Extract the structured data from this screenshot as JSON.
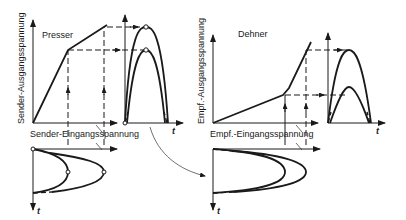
{
  "diagram": {
    "left_panel": {
      "title": "Presser",
      "y_axis_label": "Sender-Ausgangsspannung",
      "x_axis_label": "Sender-Eingangsspannung",
      "time_label": "t"
    },
    "right_panel": {
      "title": "Dehner",
      "y_axis_label": "Empf.-Ausgangsspannung",
      "x_axis_label": "Empf.-Eingangsspannung",
      "time_label": "t"
    },
    "colors": {
      "line": "#1a1a1a",
      "background": "#ffffff"
    }
  }
}
